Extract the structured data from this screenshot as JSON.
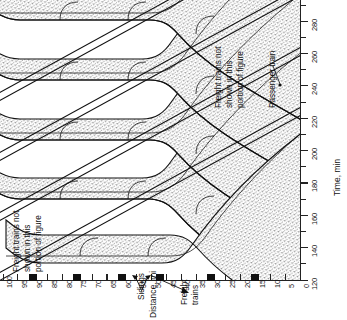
{
  "figure": {
    "kind": "train-stringline-diagram",
    "orientation": "rotated-90-ccw",
    "background": "#ffffff",
    "ink": "#111111",
    "band_fill": "stipple"
  },
  "axes": {
    "distance": {
      "title": "Distance, mi",
      "unit": "mi",
      "min": 0,
      "max": 100,
      "major_step": 5,
      "major_ticks": [
        0,
        5,
        10,
        15,
        20,
        25,
        30,
        35,
        40,
        45,
        50,
        55,
        60,
        65,
        70,
        75,
        80,
        85,
        90,
        95,
        100
      ],
      "labels": [
        "0",
        "5",
        "10",
        "15",
        "20",
        "25",
        "30",
        "35",
        "40",
        "45",
        "50",
        "55",
        "60",
        "65",
        "70",
        "75",
        "80",
        "85",
        "90",
        "95",
        "100"
      ],
      "direction": "increases right-to-left"
    },
    "time": {
      "title": "Time, min",
      "unit": "min",
      "min": 120,
      "max": 290,
      "major_step": 20,
      "minor_step": 10,
      "major_ticks": [
        120,
        140,
        160,
        180,
        200,
        220,
        240,
        260,
        280
      ],
      "labels": [
        "120",
        "140",
        "160",
        "180",
        "200",
        "220",
        "240",
        "260",
        "280"
      ],
      "direction": "increases bottom-to-top"
    }
  },
  "sidings": {
    "label": "Sidings",
    "locations_mi": [
      15,
      30,
      47,
      60,
      75,
      90
    ],
    "callout_targets_mi": [
      60,
      47
    ]
  },
  "annotations": {
    "left_note": "Freight trains not shown in this portion of figure",
    "right_note": "Freight trains not shown in this portion of figure",
    "freight_callout": "Freight trains",
    "passenger_callout": "Passenger train"
  },
  "chart_data": {
    "type": "line",
    "title": "",
    "xlabel": "Distance, mi",
    "ylabel": "Time, min",
    "xlim": [
      0,
      100
    ],
    "ylim": [
      120,
      290
    ],
    "grid": false,
    "legend": "none",
    "series": [
      {
        "name": "Freight train band 1",
        "style": "stipple-band",
        "comment": "diagonal band of freight trains with meet dwell at sidings",
        "x": [
          0,
          15,
          30,
          47,
          60,
          75,
          90,
          100
        ],
        "y": [
          120,
          131,
          142,
          155,
          165,
          177,
          188,
          196
        ]
      },
      {
        "name": "Freight train band 2",
        "style": "stipple-band",
        "x": [
          0,
          15,
          30,
          47,
          60,
          75,
          90,
          100
        ],
        "y": [
          143,
          154,
          165,
          178,
          188,
          200,
          211,
          219
        ]
      },
      {
        "name": "Freight train band 3",
        "style": "stipple-band",
        "x": [
          0,
          15,
          30,
          47,
          60,
          75,
          90,
          100
        ],
        "y": [
          166,
          177,
          188,
          201,
          211,
          223,
          234,
          242
        ]
      },
      {
        "name": "Freight train band 4",
        "style": "stipple-band",
        "x": [
          0,
          15,
          30,
          47,
          60,
          75,
          90,
          100
        ],
        "y": [
          189,
          200,
          211,
          224,
          234,
          246,
          257,
          265
        ]
      },
      {
        "name": "Freight train band 5",
        "style": "stipple-band",
        "x": [
          0,
          15,
          30,
          47,
          60,
          75,
          90,
          100
        ],
        "y": [
          212,
          223,
          234,
          247,
          257,
          269,
          280,
          288
        ]
      },
      {
        "name": "Passenger train 1",
        "style": "solid-line",
        "x": [
          0,
          100
        ],
        "y": [
          128,
          185
        ]
      },
      {
        "name": "Passenger train 2",
        "style": "solid-line",
        "x": [
          0,
          100
        ],
        "y": [
          174,
          231
        ]
      },
      {
        "name": "Passenger train 3",
        "style": "solid-line",
        "x": [
          0,
          100
        ],
        "y": [
          220,
          277
        ]
      }
    ]
  }
}
